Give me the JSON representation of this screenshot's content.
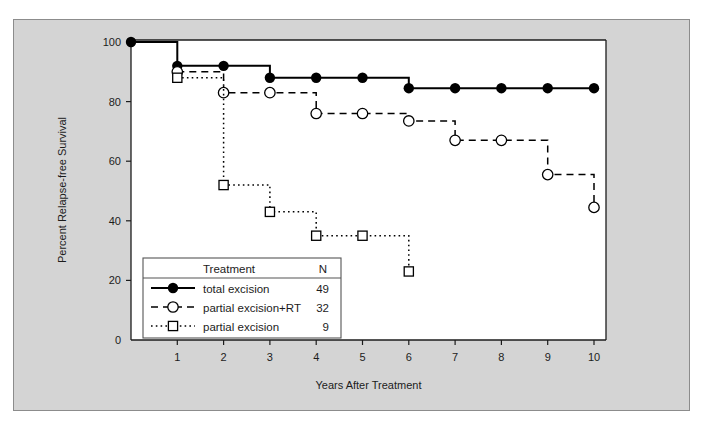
{
  "figure": {
    "background_color": "#ffffff",
    "panel_color": "#d4d4d4",
    "panel_border_color": "#8c8c8c",
    "plot_background_color": "#ffffff",
    "axis_color": "#1c1c1c"
  },
  "chart_data": {
    "type": "line",
    "title": "",
    "subtitle": "",
    "xlabel": "Years After Treatment",
    "ylabel": "Percent Relapse-free Survival",
    "xlim": [
      0,
      10.4
    ],
    "ylim": [
      0,
      103
    ],
    "xticks": [
      1,
      2,
      3,
      4,
      5,
      6,
      7,
      8,
      9,
      10
    ],
    "xtick_labels": [
      "1",
      "2",
      "3",
      "4",
      "5",
      "6",
      "7",
      "8",
      "9",
      "10"
    ],
    "yticks": [
      0,
      20,
      40,
      60,
      80,
      100
    ],
    "ytick_labels": [
      "0",
      "20",
      "40",
      "60",
      "80",
      "100"
    ],
    "grid": false,
    "step_style": "post",
    "legend_position": "lower-left-inside",
    "legend_header": {
      "treatment": "Treatment",
      "n": "N"
    },
    "series": [
      {
        "name": "total excision",
        "n": "49",
        "marker": "filled-circle",
        "line_style": "solid",
        "color": "#000000",
        "x": [
          0,
          1,
          2,
          3,
          4,
          5,
          6,
          7,
          8,
          9,
          10
        ],
        "values": [
          100,
          92,
          92,
          88,
          88,
          88,
          84.5,
          84.5,
          84.5,
          84.5,
          84.5
        ]
      },
      {
        "name": "partial excision+RT",
        "n": "32",
        "marker": "open-circle",
        "line_style": "dashed",
        "color": "#000000",
        "x": [
          1,
          2,
          3,
          4,
          5,
          6,
          7,
          8,
          9,
          10
        ],
        "values": [
          90,
          83,
          83,
          76,
          76,
          73.5,
          67,
          67,
          55.5,
          44.5
        ]
      },
      {
        "name": "partial excision",
        "n": "9",
        "marker": "open-square",
        "line_style": "dotted",
        "color": "#000000",
        "x": [
          1,
          2,
          3,
          4,
          5,
          6
        ],
        "values": [
          88,
          52,
          43,
          35,
          35,
          23
        ]
      }
    ]
  }
}
